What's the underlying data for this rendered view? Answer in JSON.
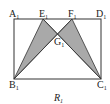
{
  "figure": {
    "caption": "R",
    "caption_sub": "1",
    "colors": {
      "stroke": "#333333",
      "fill": "#a9a9a9",
      "background": "#ffffff"
    },
    "points": {
      "A": {
        "label": "A",
        "sub": "1",
        "x": 14,
        "y": 19
      },
      "D": {
        "label": "D",
        "sub": "1",
        "x": 101,
        "y": 19
      },
      "B": {
        "label": "B",
        "sub": "1",
        "x": 14,
        "y": 79
      },
      "C": {
        "label": "C",
        "sub": "1",
        "x": 101,
        "y": 79
      },
      "E": {
        "label": "E",
        "sub": "1",
        "x": 43,
        "y": 19
      },
      "F": {
        "label": "F",
        "sub": "1",
        "x": 72,
        "y": 19
      },
      "G": {
        "label": "G",
        "sub": "1",
        "x": 57.5,
        "y": 34
      }
    },
    "shaded_triangles": [
      [
        "E",
        "B",
        "G"
      ],
      [
        "F",
        "C",
        "G"
      ]
    ],
    "segments": [
      [
        "A",
        "D"
      ],
      [
        "D",
        "C"
      ],
      [
        "C",
        "B"
      ],
      [
        "B",
        "A"
      ],
      [
        "B",
        "F"
      ],
      [
        "C",
        "E"
      ],
      [
        "B",
        "E"
      ],
      [
        "C",
        "F"
      ]
    ]
  }
}
